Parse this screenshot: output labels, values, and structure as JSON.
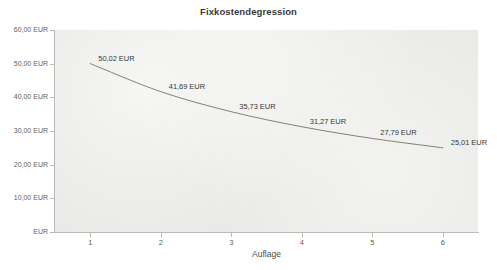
{
  "chart_data": {
    "type": "line",
    "title": "Fixkostendegression",
    "xlabel": "Auflage",
    "ylabel": "",
    "x": [
      1,
      2,
      3,
      4,
      5,
      6
    ],
    "values": [
      50.02,
      41.69,
      35.73,
      31.27,
      27.79,
      25.01
    ],
    "point_labels": [
      "50,02 EUR",
      "41,69 EUR",
      "35,73 EUR",
      "31,27 EUR",
      "27,79 EUR",
      "25,01 EUR"
    ],
    "x_tick_labels": [
      "1",
      "2",
      "3",
      "4",
      "5",
      "6"
    ],
    "y_tick_labels": [
      "60,00 EUR",
      "50,00 EUR",
      "40,00 EUR",
      "30,00 EUR",
      "20,00 EUR",
      "10,00 EUR",
      "EUR"
    ],
    "y_tick_values": [
      60,
      50,
      40,
      30,
      20,
      10,
      0
    ],
    "xlim": [
      0.5,
      6.5
    ],
    "ylim": [
      0,
      60
    ],
    "grid": false,
    "legend": false,
    "series_name": "Fixkosten je Stück",
    "colors": {
      "line": "#8c7b74",
      "plot_background": "#e9eae7",
      "page_background": "#ffffff",
      "axis": "#b9bbb7",
      "tick_text": "#5e6159",
      "title_text": "#3a3a3a",
      "label_text": "#35383a"
    }
  }
}
